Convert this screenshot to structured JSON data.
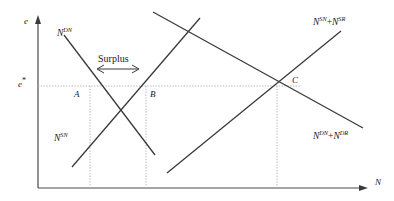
{
  "figure": {
    "type": "economics-supply-demand-diagram",
    "axes": {
      "y_axis_label": "e",
      "x_axis_label": "N",
      "y_tick_label": "e",
      "y_tick_superscript": "*"
    },
    "annotations": {
      "surplus_label": "Surplus"
    },
    "points": [
      {
        "id": "A",
        "label": "A",
        "x": 90,
        "y": 86
      },
      {
        "id": "B",
        "label": "B",
        "x": 146,
        "y": 86
      },
      {
        "id": "C",
        "label": "C",
        "x": 277,
        "y": 86
      }
    ],
    "curves": [
      {
        "id": "demand-nurses",
        "label_base": "N",
        "label_sup": "DN",
        "label_text": "N^DN",
        "kind": "demand",
        "x1": 64,
        "y1": 35,
        "x2": 155,
        "y2": 155
      },
      {
        "id": "supply-nurses",
        "label_base": "N",
        "label_sup": "SN",
        "label_text": "N^SN",
        "kind": "supply",
        "x1": 72,
        "y1": 167,
        "x2": 200,
        "y2": 18
      },
      {
        "id": "supply-aggregate",
        "label_base": "N",
        "label_sup": "SN",
        "label_base2": "N",
        "label_sup2": "SR",
        "label_operator": "+",
        "label_text": "N^SN + N^SR",
        "kind": "supply",
        "x1": 167,
        "y1": 173,
        "x2": 341,
        "y2": 31
      },
      {
        "id": "demand-aggregate",
        "label_base": "N",
        "label_sup": "DN",
        "label_base2": "N",
        "label_sup2": "DR",
        "label_operator": "+",
        "label_text": "N^DN + N^DR",
        "kind": "demand",
        "x1": 153,
        "y1": 12,
        "x2": 363,
        "y2": 128
      }
    ],
    "colors": {
      "line": "#3a3a3a",
      "axis": "#4a4a4a",
      "guide": "#b8b8b8",
      "text": "#1a1a1a",
      "background": "#ffffff"
    }
  }
}
